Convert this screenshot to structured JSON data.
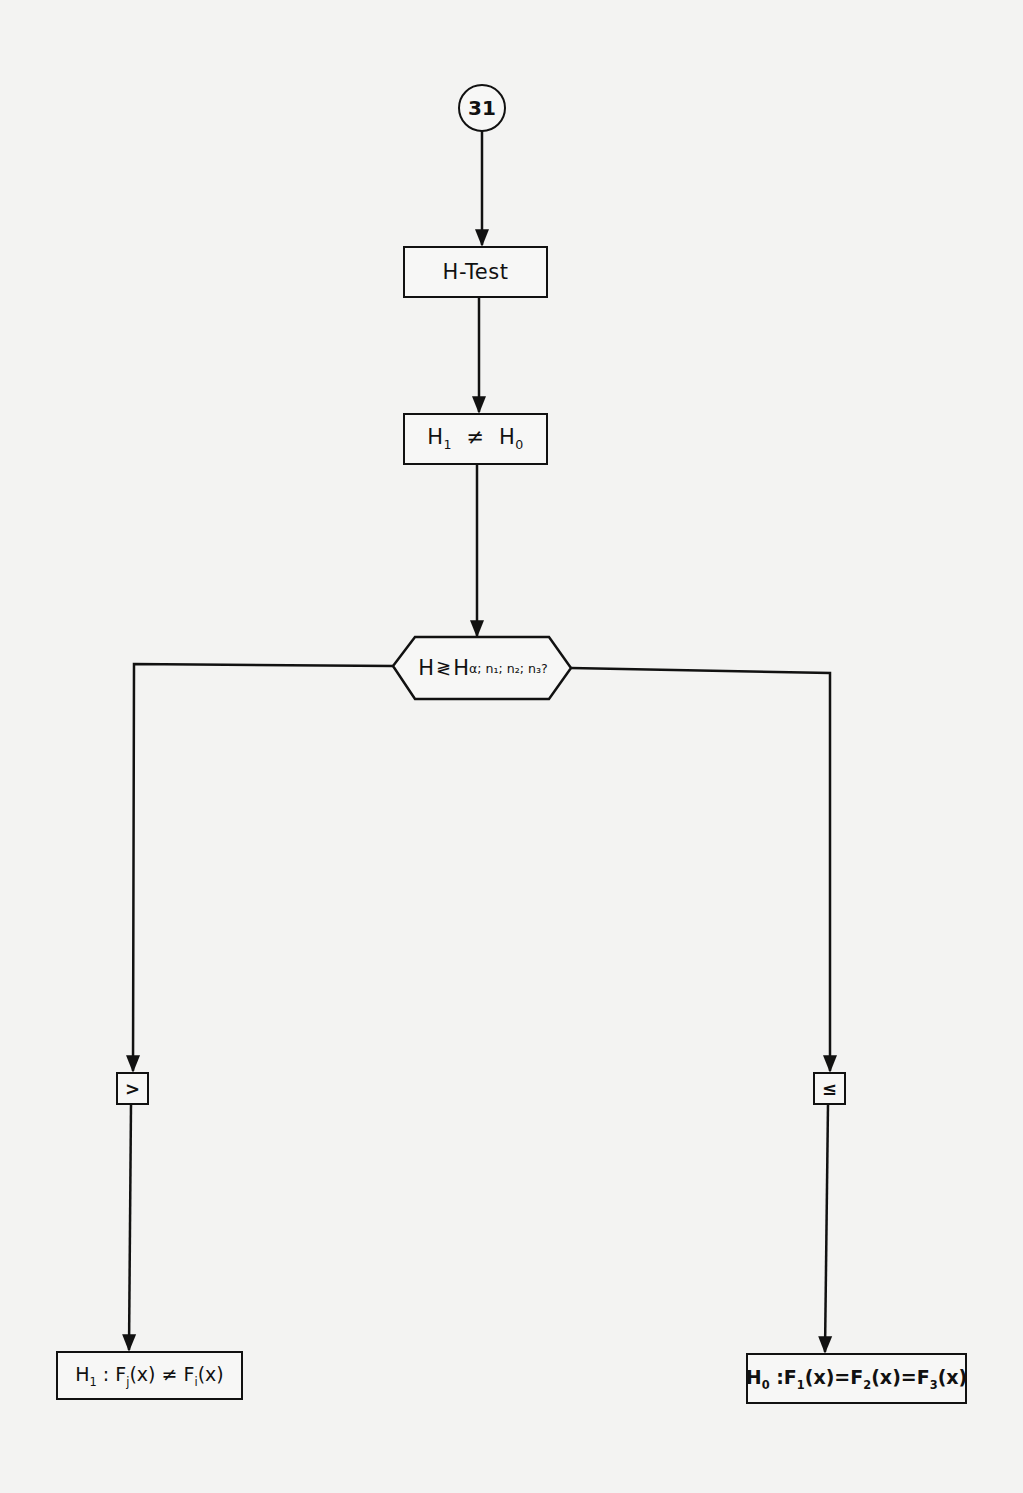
{
  "diagram": {
    "type": "flowchart",
    "connector": {
      "label": "31"
    },
    "step1": {
      "label": "H-Test"
    },
    "step2": {
      "label": "H₁ ≠ H₀",
      "left": "H",
      "left_sub": "1",
      "op": "≠",
      "right": "H",
      "right_sub": "0"
    },
    "decision": {
      "label": "H ≷ H_{α; n1; n2; n3} ?",
      "var": "H",
      "op": "≷",
      "crit": "H",
      "crit_sub": "α; n₁; n₂; n₃",
      "question": "?"
    },
    "branch_left": {
      "condition": ">",
      "result": {
        "label": "H₁ : Fj(x) ≠ Fi(x)",
        "h": "H",
        "h_sub": "1",
        "colon": " :",
        "f1": "F",
        "f1_sub": "j",
        "x1": "(x)",
        "op": "≠",
        "f2": "F",
        "f2_sub": "i",
        "x2": "(x)"
      }
    },
    "branch_right": {
      "condition": "≤",
      "result": {
        "label": "H₀ : F1(x) = F2(x) = F3(x)",
        "h": "H",
        "h_sub": "0",
        "colon": " :",
        "f1": "F",
        "f1_sub": "1",
        "x1": "(x)",
        "eq1": "=",
        "f2": "F",
        "f2_sub": "2",
        "x2": "(x)",
        "eq2": "=",
        "f3": "F",
        "f3_sub": "3",
        "x3": "(x)"
      }
    }
  },
  "colors": {
    "background": "#f3f3f2",
    "ink": "#111111"
  }
}
